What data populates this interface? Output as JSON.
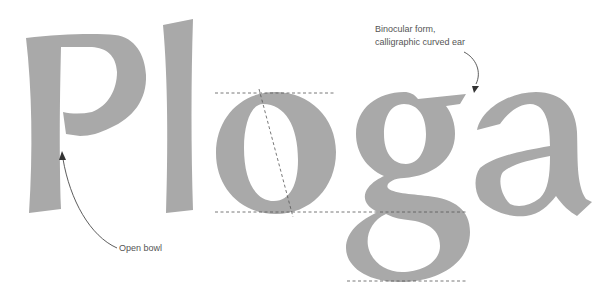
{
  "specimen": {
    "word": "Ploga",
    "glyph_color": "#a9a9a9",
    "guide_color": "#555555"
  },
  "annotations": {
    "ear": {
      "line1": "Binocular form,",
      "line2": "calligraphic curved ear"
    },
    "bowl": {
      "text": "Open bowl"
    }
  },
  "guides": {
    "x_height": "x-height line",
    "baseline": "baseline",
    "descender": "descender line",
    "axis": "stress axis"
  }
}
